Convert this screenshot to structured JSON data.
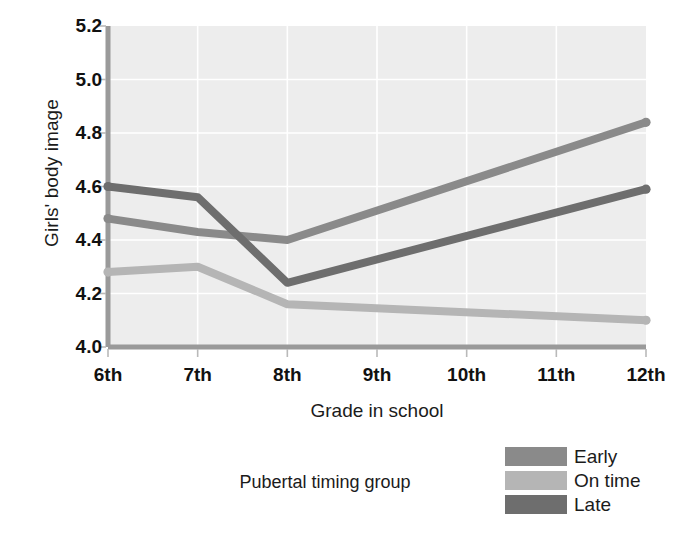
{
  "chart_data": {
    "type": "line",
    "title": "",
    "xlabel": "Grade in school",
    "ylabel": "Girls' body image",
    "categories": [
      "6th",
      "7th",
      "8th",
      "9th",
      "10th",
      "11th",
      "12th"
    ],
    "xtick_labels": [
      "6th",
      "7th",
      "8th",
      "9th",
      "10th",
      "11th",
      "12th"
    ],
    "ytick_labels": [
      "5.2",
      "5.0",
      "4.8",
      "4.6",
      "4.4",
      "4.2",
      "4.0"
    ],
    "ylim": [
      4.0,
      5.2
    ],
    "ytick_step": 0.2,
    "grid": true,
    "legend_position": "bottom-right",
    "legend_title": "Pubertal timing group",
    "series": [
      {
        "name": "Early",
        "color": "#8a8a8a",
        "x": [
          "6th",
          "7th",
          "8th",
          "12th"
        ],
        "values": [
          4.48,
          4.43,
          4.4,
          4.84
        ]
      },
      {
        "name": "On time",
        "color": "#b5b5b5",
        "x": [
          "6th",
          "7th",
          "8th",
          "12th"
        ],
        "values": [
          4.28,
          4.3,
          4.16,
          4.1
        ]
      },
      {
        "name": "Late",
        "color": "#6e6e6e",
        "x": [
          "6th",
          "7th",
          "8th",
          "12th"
        ],
        "values": [
          4.6,
          4.56,
          4.24,
          4.59
        ]
      }
    ]
  },
  "axes": {
    "y_title": "Girls' body image",
    "x_title": "Grade in school",
    "yticks": [
      "5.2",
      "5.0",
      "4.8",
      "4.6",
      "4.4",
      "4.2",
      "4.0"
    ],
    "xticks": [
      "6th",
      "7th",
      "8th",
      "9th",
      "10th",
      "11th",
      "12th"
    ]
  },
  "legend": {
    "title": "Pubertal timing group",
    "items": [
      {
        "label": "Early",
        "color": "#8a8a8a"
      },
      {
        "label": "On time",
        "color": "#b5b5b5"
      },
      {
        "label": "Late",
        "color": "#6e6e6e"
      }
    ]
  },
  "colors": {
    "plot_background": "#ededed",
    "grid": "#ffffff",
    "axis_line": "#9a9a9a",
    "text": "#1b1b1b"
  }
}
